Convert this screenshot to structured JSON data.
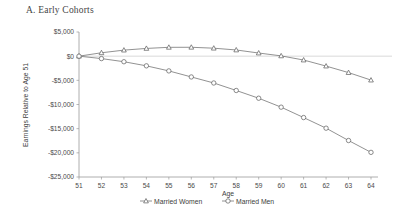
{
  "panel": {
    "label": "A.",
    "title": "A.  Early Cohorts"
  },
  "chart_data": {
    "type": "line",
    "title": "A.  Early Cohorts",
    "xlabel": "Age",
    "ylabel": "Earnings Relative to Age 51",
    "x": [
      51,
      52,
      53,
      54,
      55,
      56,
      57,
      58,
      59,
      60,
      61,
      62,
      63,
      64
    ],
    "categories": [
      "51",
      "52",
      "53",
      "54",
      "55",
      "56",
      "57",
      "58",
      "59",
      "60",
      "61",
      "62",
      "63",
      "64"
    ],
    "xlim": [
      51,
      64
    ],
    "ylim": [
      -25000,
      5000
    ],
    "yticks": [
      5000,
      0,
      -5000,
      -10000,
      -15000,
      -20000,
      -25000
    ],
    "ytick_labels": [
      "$5,000",
      "$0",
      "-$5,000",
      "-$10,000",
      "-$15,000",
      "-$20,000",
      "-$25,000"
    ],
    "xtick_labels": [
      "51",
      "52",
      "53",
      "54",
      "55",
      "56",
      "57",
      "58",
      "59",
      "60",
      "61",
      "62",
      "63",
      "64"
    ],
    "grid": false,
    "zero_reference_line": true,
    "legend_position": "below",
    "series": [
      {
        "name": "Married Women",
        "marker": "triangle",
        "values": [
          0,
          700,
          1250,
          1600,
          1830,
          1840,
          1650,
          1280,
          650,
          60,
          -800,
          -2050,
          -3400,
          -4950
        ]
      },
      {
        "name": "Married Men",
        "marker": "circle",
        "values": [
          0,
          -500,
          -1150,
          -2000,
          -3050,
          -4300,
          -5550,
          -7100,
          -8700,
          -10550,
          -12700,
          -14900,
          -17450,
          -19900
        ]
      }
    ]
  },
  "legend": {
    "items": [
      {
        "label": "Married Women",
        "marker": "triangle"
      },
      {
        "label": "Married Men",
        "marker": "circle"
      }
    ]
  },
  "colors": {
    "line": "#6e6e6e",
    "marker_stroke": "#5a5a5a",
    "axis": "#9a9a9a",
    "zero_line": "#c9c9c9",
    "text": "#3d3d3d",
    "background": "#ffffff"
  }
}
